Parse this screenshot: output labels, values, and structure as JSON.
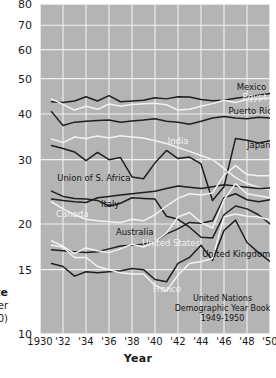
{
  "chart_data": {
    "type": "line",
    "title": "",
    "xlabel": "Year",
    "ylabel": "Rate",
    "ylabel_sub": "(per 1000)",
    "yscale": "log",
    "ylim": [
      10,
      80
    ],
    "xlim": [
      1930,
      1950
    ],
    "grid": true,
    "legend": "inline-labels",
    "ytick_labels": [
      "80",
      "70",
      "60",
      "50",
      "40",
      "30",
      "20",
      "15",
      "10"
    ],
    "ytick_values": [
      80,
      70,
      60,
      50,
      40,
      30,
      20,
      15,
      10
    ],
    "xtick_labels": [
      "1930",
      "'32",
      "'34",
      "'36",
      "'38",
      "'40",
      "'42",
      "'44",
      "'46",
      "'48",
      "'50"
    ],
    "xtick_values": [
      1930,
      1932,
      1934,
      1936,
      1938,
      1940,
      1942,
      1944,
      1946,
      1948,
      1950
    ],
    "x": [
      1931,
      1932,
      1933,
      1934,
      1935,
      1936,
      1937,
      1938,
      1939,
      1940,
      1941,
      1942,
      1943,
      1944,
      1945,
      1946,
      1947,
      1948,
      1949,
      1950
    ],
    "series": [
      {
        "name": "Mexico",
        "color": "#1f1f1f",
        "label_x": 1947.1,
        "label_y": 47.0,
        "values": [
          43.2,
          43.0,
          43.4,
          44.6,
          43.4,
          44.9,
          43.2,
          43.4,
          43.6,
          44.3,
          44.0,
          44.6,
          44.5,
          43.8,
          43.5,
          43.6,
          44.2,
          44.6,
          45.0,
          45.5
        ]
      },
      {
        "name": "Egypt",
        "color": "#f2f2f2",
        "label_x": 1947.6,
        "label_y": 44.2,
        "values": [
          44.0,
          42.5,
          41.0,
          42.0,
          41.2,
          42.6,
          42.0,
          42.5,
          42.7,
          42.8,
          42.4,
          41.0,
          41.2,
          42.0,
          42.7,
          43.6,
          43.0,
          43.8,
          44.0,
          44.3
        ]
      },
      {
        "name": "Puerto Rico",
        "color": "#1f1f1f",
        "label_x": 1946.4,
        "label_y": 40.4,
        "values": [
          40.6,
          37.2,
          38.0,
          38.2,
          38.4,
          38.5,
          38.0,
          38.3,
          38.5,
          38.8,
          38.2,
          38.0,
          37.5,
          38.2,
          39.0,
          39.4,
          39.0,
          38.8,
          39.2,
          39.0
        ]
      },
      {
        "name": "India",
        "color": "#f2f2f2",
        "label_x": 1941.1,
        "label_y": 33.6,
        "values": [
          34.2,
          33.4,
          34.6,
          34.3,
          34.8,
          34.4,
          34.9,
          34.6,
          34.4,
          33.8,
          33.2,
          32.4,
          31.6,
          30.8,
          30.0,
          28.4,
          26.8,
          25.8,
          25.2,
          24.9
        ]
      },
      {
        "name": "Japan",
        "color": "#1f1f1f",
        "label_x": 1948.0,
        "label_y": 32.6,
        "values": [
          32.8,
          32.2,
          31.5,
          29.8,
          31.4,
          30.0,
          30.4,
          26.9,
          26.6,
          29.4,
          31.8,
          30.2,
          30.5,
          29.2,
          23.2,
          25.3,
          34.3,
          33.9,
          33.3,
          33.8
        ]
      },
      {
        "name": "Union of S. Africa",
        "color": "#1f1f1f",
        "label_x": 1931.5,
        "label_y": 26.5,
        "values": [
          23.4,
          23.2,
          23.0,
          22.9,
          23.6,
          23.8,
          24.0,
          24.2,
          24.4,
          24.6,
          25.0,
          25.4,
          25.2,
          25.0,
          25.3,
          25.6,
          25.4,
          25.2,
          25.0,
          25.1
        ]
      },
      {
        "name": "Italy",
        "color": "#1f1f1f",
        "label_x": 1935.3,
        "label_y": 22.5,
        "values": [
          24.6,
          23.8,
          23.5,
          23.4,
          23.2,
          22.4,
          22.8,
          23.6,
          23.5,
          23.4,
          21.0,
          20.6,
          19.6,
          18.4,
          18.3,
          21.2,
          22.4,
          22.0,
          21.2,
          20.0
        ]
      },
      {
        "name": "Canada",
        "color": "#f2f2f2",
        "label_x": 1931.4,
        "label_y": 21.2,
        "values": [
          23.0,
          22.0,
          21.2,
          20.6,
          20.4,
          20.3,
          20.2,
          20.6,
          20.4,
          21.2,
          22.4,
          23.5,
          24.2,
          24.0,
          24.3,
          27.2,
          28.9,
          27.3,
          27.1,
          27.1
        ]
      },
      {
        "name": "Australia",
        "color": "#1f1f1f",
        "label_x": 1936.6,
        "label_y": 18.9,
        "values": [
          17.0,
          16.9,
          16.8,
          16.7,
          16.8,
          17.1,
          17.4,
          17.5,
          17.6,
          17.9,
          18.8,
          19.4,
          20.2,
          20.1,
          20.4,
          23.6,
          24.2,
          23.3,
          23.0,
          23.3
        ]
      },
      {
        "name": "United States",
        "color": "#f2f2f2",
        "label_x": 1938.9,
        "label_y": 17.6,
        "values": [
          18.0,
          17.4,
          16.6,
          17.2,
          16.9,
          16.7,
          17.1,
          17.6,
          17.3,
          17.9,
          18.9,
          20.9,
          21.5,
          20.2,
          19.5,
          23.3,
          25.8,
          24.2,
          23.9,
          23.6
        ]
      },
      {
        "name": "United Kingdom",
        "color": "#1f1f1f",
        "label_x": 1944.1,
        "label_y": 16.5,
        "values": [
          15.6,
          15.3,
          14.4,
          14.8,
          14.7,
          14.8,
          14.9,
          15.1,
          15.0,
          14.1,
          13.9,
          15.6,
          16.2,
          17.5,
          15.9,
          19.2,
          20.5,
          17.8,
          16.7,
          15.8
        ]
      },
      {
        "name": "France",
        "color": "#f2f2f2",
        "label_x": 1939.8,
        "label_y": 13.2,
        "values": [
          17.5,
          17.3,
          16.2,
          16.2,
          15.3,
          15.0,
          14.7,
          14.6,
          14.6,
          13.6,
          13.1,
          14.5,
          15.6,
          15.8,
          16.1,
          20.9,
          21.3,
          21.0,
          20.9,
          20.5
        ]
      }
    ],
    "source_note": [
      "United Nations",
      "Demographic Year Book",
      "1949-1950"
    ]
  }
}
